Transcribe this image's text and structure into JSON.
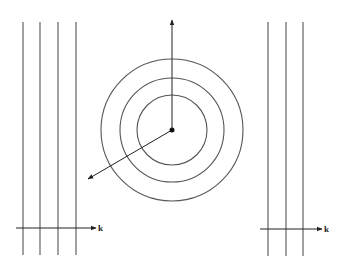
{
  "figure": {
    "left_panel": {
      "wavefront_xs": [
        23,
        40,
        58,
        76
      ],
      "y_top": 22,
      "y_bottom": 255,
      "arrow": {
        "x1": 16,
        "x2": 96,
        "y": 228
      },
      "label": "k"
    },
    "center_panel": {
      "center": [
        172,
        130
      ],
      "radii": [
        35,
        52,
        71
      ],
      "arrows": [
        {
          "x2": 172,
          "y2": 20
        },
        {
          "x2": 88,
          "y2": 179
        }
      ]
    },
    "right_panel": {
      "wavefront_xs": [
        268,
        286,
        303
      ],
      "y_top": 22,
      "y_bottom": 256,
      "arrow": {
        "x1": 260,
        "x2": 322,
        "y": 229
      },
      "label": "k"
    },
    "line_color": "#555555",
    "arrow_color": "#222222"
  }
}
